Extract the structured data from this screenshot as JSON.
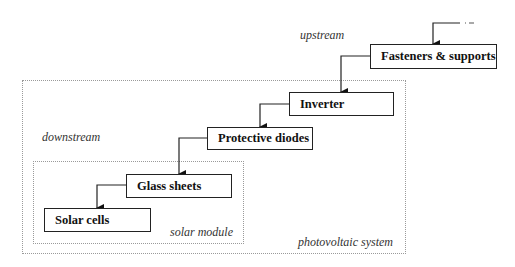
{
  "diagram": {
    "labels": {
      "upstream": "upstream",
      "downstream": "downstream",
      "solar_module": "solar module",
      "photovoltaic_system": "photovoltaic system"
    },
    "nodes": [
      {
        "id": "fasteners",
        "label": "Fasteners & supports"
      },
      {
        "id": "inverter",
        "label": "Inverter"
      },
      {
        "id": "diodes",
        "label": "Protective diodes"
      },
      {
        "id": "glass",
        "label": "Glass sheets"
      },
      {
        "id": "cells",
        "label": "Solar cells"
      }
    ],
    "edges": [
      {
        "from": "external",
        "to": "fasteners",
        "style": "dashed-start"
      },
      {
        "from": "fasteners",
        "to": "inverter"
      },
      {
        "from": "inverter",
        "to": "diodes"
      },
      {
        "from": "diodes",
        "to": "glass"
      },
      {
        "from": "glass",
        "to": "cells"
      }
    ],
    "groups": [
      {
        "id": "photovoltaic_system",
        "contains": [
          "inverter",
          "diodes",
          "glass",
          "cells"
        ]
      },
      {
        "id": "solar_module",
        "contains": [
          "glass",
          "cells"
        ]
      }
    ]
  }
}
